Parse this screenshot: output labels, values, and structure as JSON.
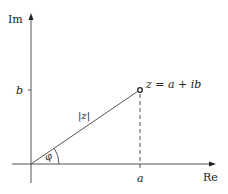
{
  "diagram": {
    "axes": {
      "x_label": "Re",
      "y_label": "Im"
    },
    "ticks": {
      "x_tick_label": "a",
      "y_tick_label": "b"
    },
    "point": {
      "label": "z = a + ib"
    },
    "modulus_label": "|z|",
    "angle_label": "φ",
    "colors": {
      "line": "#555555",
      "text": "#222222",
      "background": "#ffffff"
    }
  }
}
